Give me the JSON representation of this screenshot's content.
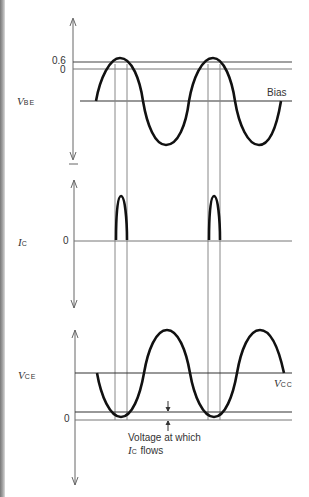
{
  "diagram": {
    "panels": [
      {
        "id": "vbe",
        "label_main": "V",
        "label_sub": "BE",
        "ticks": [
          "0.6",
          "0"
        ],
        "annotation": "Bias"
      },
      {
        "id": "ic",
        "label_main": "I",
        "label_sub": "C",
        "ticks": [
          "0"
        ]
      },
      {
        "id": "vce",
        "label_main": "V",
        "label_sub": "CE",
        "ticks": [
          "0"
        ],
        "annotation": "V",
        "annotation_sub": "CC",
        "note_line1": "Voltage at which",
        "note_line2_main": "I",
        "note_line2_sub": "C",
        "note_line2_rest": " flows"
      }
    ]
  }
}
